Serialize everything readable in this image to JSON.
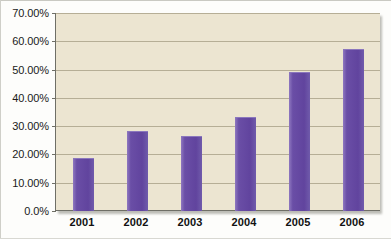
{
  "chart_data": {
    "type": "bar",
    "title": "",
    "subtitle": "",
    "xlabel": "",
    "ylabel": "",
    "categories": [
      "2001",
      "2002",
      "2003",
      "2004",
      "2005",
      "2006"
    ],
    "values": [
      18.5,
      28.0,
      26.0,
      33.0,
      48.8,
      57.0
    ],
    "value_format": "percent",
    "ylim": [
      0,
      70
    ],
    "ytick_values": [
      0,
      10,
      20,
      30,
      40,
      50,
      60,
      70
    ],
    "ytick_labels": [
      "0.0%",
      "10.00%",
      "20.00%",
      "30.00%",
      "40.00%",
      "50.00%",
      "60.00%",
      "70.00%"
    ],
    "grid": true,
    "grid_axis": "y",
    "legend": false,
    "legend_position": "none",
    "series": [
      {
        "name": "",
        "values": [
          18.5,
          28.0,
          26.0,
          33.0,
          48.8,
          57.0
        ],
        "color": "#6a4ea6"
      }
    ],
    "annotations": []
  },
  "style": {
    "plot_background": "#ECE5D1",
    "page_background": "#FDFDFB",
    "bar_color": "#6A4EA6",
    "gridline_color": "#B6AE96",
    "axis_color": "#6F6F66",
    "tick_label_color": "#1A1A1A"
  }
}
